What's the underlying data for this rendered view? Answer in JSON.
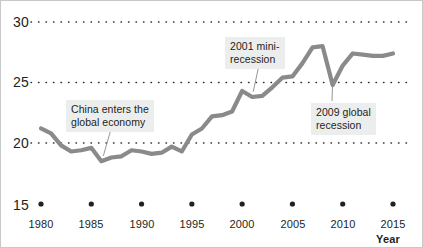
{
  "chart_data": {
    "type": "line",
    "title": "",
    "subtitle": "",
    "xlabel": "Year",
    "ylabel": "",
    "xlim": [
      1979,
      2016
    ],
    "ylim": [
      15,
      30.5
    ],
    "grid": "horizontal-dotted",
    "legend": "none",
    "y_ticks": [
      30,
      25,
      20,
      15
    ],
    "y_tick_labels": [
      "30",
      "25",
      "20",
      "15"
    ],
    "x_ticks": [
      1980,
      1985,
      1990,
      1995,
      2000,
      2005,
      2010,
      2015
    ],
    "x_tick_labels": [
      "1980",
      "1985",
      "1990",
      "1995",
      "2000",
      "2005",
      "2010",
      "2015"
    ],
    "series": [
      {
        "name": "World trade share",
        "color": "#8a8a8a",
        "x": [
          1980,
          1981,
          1982,
          1983,
          1984,
          1985,
          1986,
          1987,
          1988,
          1989,
          1990,
          1991,
          1992,
          1993,
          1994,
          1995,
          1996,
          1997,
          1998,
          1999,
          2000,
          2001,
          2002,
          2003,
          2004,
          2005,
          2006,
          2007,
          2008,
          2009,
          2010,
          2011,
          2012,
          2013,
          2014,
          2015
        ],
        "values": [
          21.2,
          20.8,
          19.8,
          19.3,
          19.4,
          19.6,
          18.5,
          18.8,
          18.9,
          19.4,
          19.3,
          19.1,
          19.2,
          19.7,
          19.3,
          20.7,
          21.2,
          22.2,
          22.3,
          22.6,
          24.3,
          23.8,
          23.9,
          24.6,
          25.4,
          25.5,
          26.6,
          27.9,
          28.0,
          24.8,
          26.4,
          27.4,
          27.3,
          27.2,
          27.2,
          27.4
        ]
      }
    ],
    "annotations": [
      {
        "id": "china-annotation",
        "text": "China enters the\nglobal economy",
        "points_to_year": 1986,
        "points_to_value": 18.6
      },
      {
        "id": "recession-2001-annotation",
        "text": "2001 mini-\nrecession",
        "points_to_year": 2001,
        "points_to_value": 23.9
      },
      {
        "id": "recession-2009-annotation",
        "text": "2009 global\nrecession",
        "points_to_year": 2009,
        "points_to_value": 24.9
      }
    ]
  },
  "colors": {
    "line": "#8a8a8a",
    "grid": "#2b2b2b",
    "text": "#231f20",
    "annotation_background": "#eceded",
    "frame": "#c8c8c8"
  }
}
